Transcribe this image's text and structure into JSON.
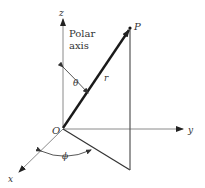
{
  "diagram": {
    "labels": {
      "z_axis": "z",
      "y_axis": "y",
      "x_axis": "x",
      "polar_axis_line1": "Polar",
      "polar_axis_line2": "axis",
      "origin": "O",
      "point": "P",
      "radius": "r",
      "theta": "θ",
      "phi": "ϕ"
    },
    "colors": {
      "axis": "#888888",
      "vector": "#1a1a1a",
      "projection": "#333333",
      "text": "#333333"
    }
  }
}
